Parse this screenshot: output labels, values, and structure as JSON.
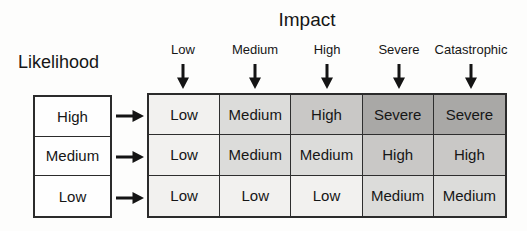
{
  "title": "Impact",
  "likelihood_label": "Likelihood",
  "impact_headers": [
    {
      "label": "Low"
    },
    {
      "label": "Medium"
    },
    {
      "label": "High"
    },
    {
      "label": "Severe"
    },
    {
      "label": "Catastrophic"
    }
  ],
  "likelihood_rows": [
    {
      "label": "High"
    },
    {
      "label": "Medium"
    },
    {
      "label": "Low"
    }
  ],
  "matrix": {
    "rows": [
      {
        "likelihood": "High",
        "cells": [
          {
            "label": "Low",
            "level": "low"
          },
          {
            "label": "Medium",
            "level": "medium"
          },
          {
            "label": "High",
            "level": "high"
          },
          {
            "label": "Severe",
            "level": "severe"
          },
          {
            "label": "Severe",
            "level": "severe"
          }
        ]
      },
      {
        "likelihood": "Medium",
        "cells": [
          {
            "label": "Low",
            "level": "low"
          },
          {
            "label": "Medium",
            "level": "medium"
          },
          {
            "label": "Medium",
            "level": "medium"
          },
          {
            "label": "High",
            "level": "high"
          },
          {
            "label": "High",
            "level": "high"
          }
        ]
      },
      {
        "likelihood": "Low",
        "cells": [
          {
            "label": "Low",
            "level": "low"
          },
          {
            "label": "Low",
            "level": "low"
          },
          {
            "label": "Low",
            "level": "low"
          },
          {
            "label": "Medium",
            "level": "medium"
          },
          {
            "label": "Medium",
            "level": "medium"
          }
        ]
      }
    ]
  },
  "colors": {
    "low": "#f2f1ef",
    "medium": "#dcdcda",
    "high": "#c9c8c6",
    "severe": "#a9a8a6",
    "border": "#2b2b2b",
    "text": "#161616"
  },
  "icons": {
    "down_arrow": "down-arrow",
    "right_arrow": "right-arrow"
  }
}
